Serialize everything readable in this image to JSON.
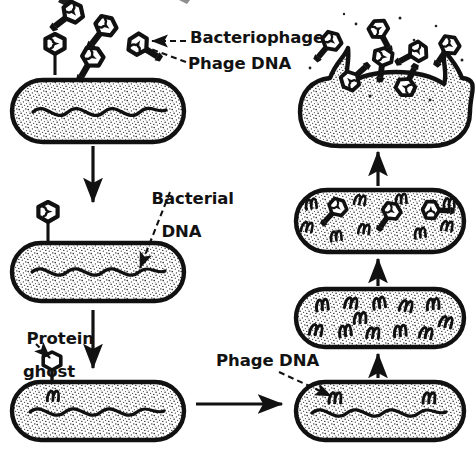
{
  "figure": {
    "background_color": "#ffffff",
    "ink_color": "#111111",
    "stipple_color": "#2b2b2b"
  },
  "labels": {
    "bacteriophage": "Bacteriophage",
    "phage_dna_top": "Phage DNA",
    "bacterial_dna_line1": "Bacterial",
    "bacterial_dna_line2": "DNA",
    "protein_ghost_line1": "Protein",
    "protein_ghost_line2": "ghost",
    "phage_dna_bottom": "Phage DNA"
  },
  "stages": [
    {
      "id": "stage-1-attachment",
      "name": "Phage attaches to bacterium",
      "column": "left",
      "free_phage_count": 5,
      "attached_phage_count": 1,
      "bacterial_dna": true,
      "phage_dna_coils": 0,
      "assembled_phages_inside": 0,
      "lysed": false
    },
    {
      "id": "stage-2-injection",
      "name": "Phage injects DNA into bacterium",
      "column": "left",
      "free_phage_count": 0,
      "attached_phage_count": 1,
      "bacterial_dna": true,
      "phage_dna_coils": 0,
      "assembled_phages_inside": 0,
      "lysed": false
    },
    {
      "id": "stage-3-protein-ghost",
      "name": "Empty protein ghost remains outside; phage DNA inside",
      "column": "left",
      "free_phage_count": 0,
      "attached_phage_count": 0,
      "ghost_attached": true,
      "bacterial_dna": true,
      "phage_dna_coils": 1,
      "assembled_phages_inside": 0,
      "lysed": false
    },
    {
      "id": "stage-4-early-replication",
      "name": "Phage DNA begins to replicate",
      "column": "right",
      "bacterial_dna": true,
      "phage_dna_coils": 2,
      "assembled_phages_inside": 0,
      "lysed": false
    },
    {
      "id": "stage-5-replication",
      "name": "Phage DNA multiplies; bacterial DNA destroyed",
      "column": "right",
      "bacterial_dna": false,
      "phage_dna_coils": 12,
      "assembled_phages_inside": 0,
      "lysed": false
    },
    {
      "id": "stage-6-assembly",
      "name": "New phage particles assemble",
      "column": "right",
      "bacterial_dna": false,
      "phage_dna_coils": 10,
      "assembled_phages_inside": 3,
      "lysed": false
    },
    {
      "id": "stage-7-lysis",
      "name": "Cell lyses and releases new bacteriophages",
      "column": "right",
      "bacterial_dna": false,
      "phage_dna_coils": 0,
      "released_phage_count": 7,
      "lysed": true
    }
  ],
  "arrows": [
    {
      "id": "arrow-stage1-to-stage2",
      "direction": "down",
      "column": "left"
    },
    {
      "id": "arrow-stage2-to-stage3",
      "direction": "down",
      "column": "left"
    },
    {
      "id": "arrow-stage3-to-stage4",
      "direction": "right",
      "column": "bottom"
    },
    {
      "id": "arrow-stage4-to-stage5",
      "direction": "up",
      "column": "right"
    },
    {
      "id": "arrow-stage5-to-stage6",
      "direction": "up",
      "column": "right"
    },
    {
      "id": "arrow-stage6-to-stage7",
      "direction": "up",
      "column": "right"
    }
  ],
  "pointers": [
    {
      "id": "pointer-bacteriophage",
      "style": "dashed",
      "target": "free phage head"
    },
    {
      "id": "pointer-phage-dna-top",
      "style": "dashed",
      "target": "DNA inside phage head"
    },
    {
      "id": "pointer-bacterial-dna",
      "style": "dashed",
      "target": "wavy DNA strand in bacterium"
    },
    {
      "id": "pointer-protein-ghost",
      "style": "dashed",
      "target": "empty phage coat"
    },
    {
      "id": "pointer-phage-dna-bottom",
      "style": "dashed",
      "target": "coiled phage DNA in cell"
    }
  ]
}
